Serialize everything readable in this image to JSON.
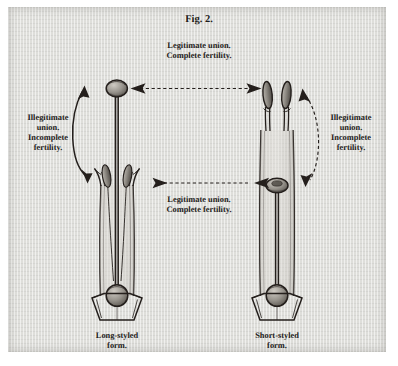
{
  "figure": {
    "title": "Fig. 2.",
    "caption_top": [
      "Legitimate union.",
      "Complete fertility."
    ],
    "caption_middle": [
      "Legitimate union.",
      "Complete fertility."
    ],
    "label_left": [
      "Illegitimate",
      "union.",
      "Incomplete",
      "fertility."
    ],
    "label_right": [
      "Illegitimate",
      "union.",
      "Incomplete",
      "fertility."
    ],
    "caption_left_form": [
      "Long-styled",
      "form."
    ],
    "caption_right_form": [
      "Short-styled",
      "form."
    ],
    "colors": {
      "paper": "#dededa",
      "ink": "#241f1c",
      "page": "#ffffff",
      "organ_shade": "#8d8983"
    }
  }
}
